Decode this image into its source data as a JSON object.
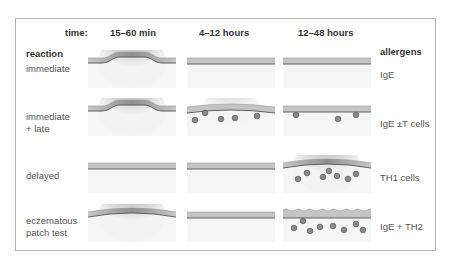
{
  "header": {
    "time_label": "time:",
    "columns": [
      "15–60 min",
      "4–12 hours",
      "12–48 hours"
    ],
    "reaction_label": "reaction",
    "allergens_label": "allergens"
  },
  "rows": [
    {
      "reaction": "immediate",
      "allergens": "IgE",
      "panels": [
        {
          "shape": "bump",
          "inflammation": "strong",
          "cells": []
        },
        {
          "shape": "flat",
          "inflammation": "none",
          "cells": []
        },
        {
          "shape": "flat",
          "inflammation": "none",
          "cells": []
        }
      ]
    },
    {
      "reaction": "immediate\n+ late",
      "allergens": "IgE ±T cells",
      "panels": [
        {
          "shape": "bump",
          "inflammation": "strong",
          "cells": []
        },
        {
          "shape": "slight-curve",
          "inflammation": "mild",
          "cells": [
            [
              8,
              22
            ],
            [
              18,
              15
            ],
            [
              34,
              21
            ],
            [
              48,
              20
            ],
            [
              70,
              18
            ]
          ]
        },
        {
          "shape": "flat",
          "inflammation": "none",
          "cells": [
            [
              13,
              17
            ],
            [
              55,
              21
            ],
            [
              73,
              17
            ]
          ]
        }
      ]
    },
    {
      "reaction": "delayed",
      "allergens": "TH1 cells",
      "panels": [
        {
          "shape": "flat",
          "inflammation": "none",
          "cells": []
        },
        {
          "shape": "flat",
          "inflammation": "none",
          "cells": []
        },
        {
          "shape": "curve",
          "inflammation": "strong",
          "cells": [
            [
              15,
              24
            ],
            [
              24,
              18
            ],
            [
              40,
              22
            ],
            [
              46,
              16
            ],
            [
              54,
              21
            ],
            [
              65,
              24
            ],
            [
              73,
              19
            ]
          ]
        }
      ]
    },
    {
      "reaction": "eczematous\npatch test",
      "allergens": "IgE + TH2",
      "panels": [
        {
          "shape": "curve",
          "inflammation": "strong",
          "cells": []
        },
        {
          "shape": "flat",
          "inflammation": "none",
          "cells": []
        },
        {
          "shape": "wavy",
          "inflammation": "none",
          "cells": [
            [
              11,
              24
            ],
            [
              20,
              17
            ],
            [
              27,
              27
            ],
            [
              37,
              23
            ],
            [
              50,
              22
            ],
            [
              61,
              26
            ],
            [
              73,
              20
            ],
            [
              80,
              26
            ]
          ]
        }
      ]
    }
  ],
  "colors": {
    "skin_fill": "#c4c4c4",
    "skin_line": "#555555",
    "cell_fill": "#8a8a8a",
    "cell_stroke": "#555555",
    "frame": "#b5b5b5",
    "text": "#555555"
  }
}
